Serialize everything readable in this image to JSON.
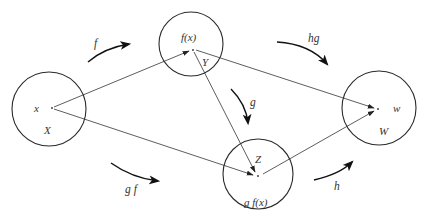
{
  "diagram": {
    "sets": [
      {
        "id": "X",
        "label": "X",
        "cx": 49,
        "cy": 109,
        "r": 37,
        "point_label": "x",
        "px": 52,
        "py": 108
      },
      {
        "id": "Y",
        "label": "Y",
        "cx": 191,
        "cy": 44,
        "r": 32,
        "point_label": "f(x)",
        "px": 193,
        "py": 50
      },
      {
        "id": "Z",
        "label": "Z",
        "cx": 258,
        "cy": 174,
        "r": 35,
        "point_label": "g f(x)",
        "px": 258,
        "py": 176
      },
      {
        "id": "W",
        "label": "W",
        "cx": 379,
        "cy": 108,
        "r": 37,
        "point_label": "w",
        "px": 378,
        "py": 109
      }
    ],
    "mappings": [
      {
        "from": "x",
        "to": "f(x)"
      },
      {
        "from": "x",
        "to": "g f(x)"
      },
      {
        "from": "f(x)",
        "to": "g f(x)"
      },
      {
        "from": "f(x)",
        "to": "w"
      },
      {
        "from": "g f(x)",
        "to": "w"
      }
    ],
    "function_arrows": [
      {
        "label": "f"
      },
      {
        "label": "hg"
      },
      {
        "label": "g"
      },
      {
        "label": "g f"
      },
      {
        "label": "h"
      }
    ]
  },
  "colors": {
    "stroke": "#2a2a2a",
    "text": "#333333",
    "background": "#ffffff"
  }
}
